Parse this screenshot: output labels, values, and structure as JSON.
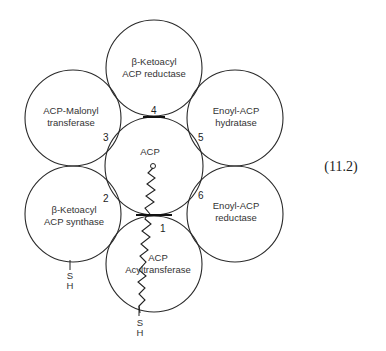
{
  "diagram": {
    "equation_label": "(11.2)",
    "domains": [
      {
        "id": "top",
        "line1": "β-Ketoacyl",
        "line2": "ACP reductase"
      },
      {
        "id": "upper-left",
        "line1": "ACP-Malonyl",
        "line2": "transferase"
      },
      {
        "id": "upper-right",
        "line1": "Enoyl-ACP",
        "line2": "hydratase"
      },
      {
        "id": "center",
        "line1": "ACP",
        "line2": ""
      },
      {
        "id": "lower-left",
        "line1": "β-Ketoacyl",
        "line2": "ACP synthase"
      },
      {
        "id": "lower-right",
        "line1": "Enoyl-ACP",
        "line2": "reductase"
      },
      {
        "id": "bottom",
        "line1": "ACP",
        "line2": "Acyltransferase"
      }
    ],
    "contact_numbers": [
      "1",
      "2",
      "3",
      "4",
      "5",
      "6"
    ],
    "thiol_groups": [
      {
        "atom1": "S",
        "atom2": "H"
      },
      {
        "atom1": "S",
        "atom2": "H"
      }
    ]
  }
}
